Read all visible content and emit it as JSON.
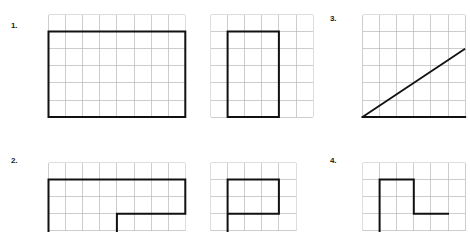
{
  "page": {
    "background": "#ffffff",
    "grid_line_color": "#b8b8b8",
    "shape_line_color": "#111111",
    "width": 429,
    "height": 231
  },
  "problems": [
    {
      "number": "1.",
      "figures": [
        {
          "id": "p1-fig-a",
          "grid": {
            "cols": 8,
            "rows": 6,
            "cell": 17.1,
            "x": 48,
            "y": 14
          },
          "shape": {
            "type": "rectangle",
            "kind": "closed-polygon",
            "cells_wide": 8,
            "cells_tall": 5,
            "vertices_in_cells": [
              [
                0,
                1
              ],
              [
                8,
                1
              ],
              [
                8,
                6
              ],
              [
                0,
                6
              ]
            ]
          }
        },
        {
          "id": "p1-fig-b",
          "grid": {
            "cols": 6,
            "rows": 6,
            "cell": 17.1,
            "x": 210,
            "y": 14
          },
          "shape": {
            "type": "rectangle",
            "kind": "closed-polygon",
            "cells_wide": 3,
            "cells_tall": 5,
            "vertices_in_cells": [
              [
                1,
                1
              ],
              [
                4,
                1
              ],
              [
                4,
                6
              ],
              [
                1,
                6
              ]
            ]
          }
        }
      ]
    },
    {
      "number": "3.",
      "figures": [
        {
          "id": "p3-fig-a",
          "grid": {
            "cols": 6,
            "rows": 6,
            "cell": 17.1,
            "x": 362,
            "y": 14
          },
          "shape": {
            "type": "diagonal-with-base",
            "kind": "open-path",
            "vertices_in_cells": [
              [
                0,
                6
              ],
              [
                6,
                2
              ]
            ],
            "base_in_cells": [
              [
                0,
                6
              ],
              [
                6,
                6
              ]
            ]
          }
        }
      ]
    },
    {
      "number": "2.",
      "figures": [
        {
          "id": "p2-fig-a",
          "grid": {
            "cols": 8,
            "rows": 4,
            "cell": 17.1,
            "x": 48,
            "y": 162
          },
          "shape": {
            "type": "l-shape",
            "kind": "open-polygon",
            "vertices_in_cells": [
              [
                0,
                4
              ],
              [
                0,
                1
              ],
              [
                8,
                1
              ],
              [
                8,
                3
              ],
              [
                4,
                3
              ],
              [
                4,
                4
              ]
            ]
          }
        },
        {
          "id": "p2-fig-b",
          "grid": {
            "cols": 6,
            "rows": 4,
            "cell": 17.1,
            "x": 210,
            "y": 162
          },
          "shape": {
            "type": "l-shape",
            "kind": "open-polygon",
            "vertices_in_cells": [
              [
                1,
                4
              ],
              [
                1,
                1
              ],
              [
                4,
                1
              ],
              [
                4,
                3
              ],
              [
                1,
                3
              ]
            ]
          }
        }
      ]
    },
    {
      "number": "4.",
      "figures": [
        {
          "id": "p4-fig-a",
          "grid": {
            "cols": 6,
            "rows": 4,
            "cell": 17.1,
            "x": 362,
            "y": 162
          },
          "shape": {
            "type": "step-shape",
            "kind": "open-polygon",
            "vertices_in_cells": [
              [
                0,
                4
              ],
              [
                0,
                1
              ],
              [
                2,
                1
              ],
              [
                2,
                3
              ],
              [
                4,
                3
              ]
            ]
          }
        }
      ]
    }
  ]
}
